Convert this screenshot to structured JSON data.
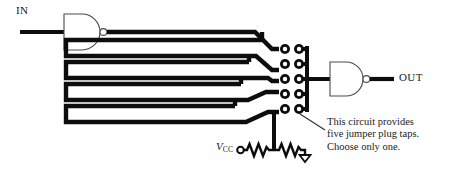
{
  "diagram": {
    "type": "schematic",
    "labels": {
      "input": "IN",
      "output": "OUT",
      "supply": "V",
      "supply_subscript": "CC"
    },
    "annotation": {
      "line1": "This circuit provides",
      "line2": "five jumper plug taps.",
      "line3": "Choose only one."
    },
    "components": {
      "input_gate": "nand-gate-inverting",
      "output_gate": "nand-gate-inverting",
      "tap_pads_rows": 5,
      "tap_pads_columns": 2,
      "resistors": 2,
      "ground_symbol": "arrow-ground"
    },
    "colors": {
      "trace": "#0d0d0d",
      "outline": "#4a4a4a",
      "background": "#ffffff",
      "text": "#1a1a1a"
    }
  }
}
